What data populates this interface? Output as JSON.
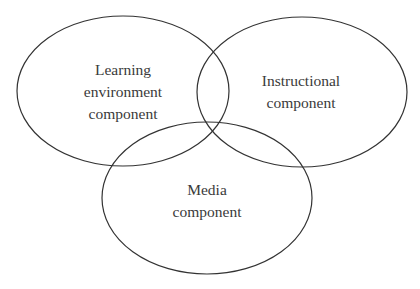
{
  "diagram": {
    "type": "venn",
    "sets": [
      {
        "id": "learning-environment",
        "label_lines": [
          "Learning",
          "environment",
          "component"
        ]
      },
      {
        "id": "instructional",
        "label_lines": [
          "Instructional",
          "component"
        ]
      },
      {
        "id": "media",
        "label_lines": [
          "Media",
          "component"
        ]
      }
    ],
    "colors": {
      "stroke": "#333333",
      "text": "#3a3a3a",
      "background": "#ffffff"
    }
  }
}
